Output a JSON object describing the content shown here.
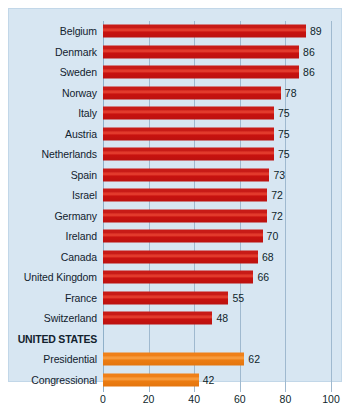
{
  "chart_data": {
    "type": "bar",
    "orientation": "horizontal",
    "title": "",
    "xlabel": "",
    "ylabel": "",
    "xlim": [
      0,
      100
    ],
    "xticks": [
      0,
      20,
      40,
      60,
      80,
      100
    ],
    "grid": true,
    "legend": "none",
    "categories": [
      "Belgium",
      "Denmark",
      "Sweden",
      "Norway",
      "Italy",
      "Austria",
      "Netherlands",
      "Spain",
      "Israel",
      "Germany",
      "Ireland",
      "Canada",
      "United Kingdom",
      "France",
      "Switzerland",
      "UNITED STATES",
      "Presidential",
      "Congressional"
    ],
    "values": [
      89,
      86,
      86,
      78,
      75,
      75,
      75,
      73,
      72,
      72,
      70,
      68,
      66,
      55,
      48,
      null,
      62,
      42
    ],
    "rows": [
      {
        "label": "Belgium",
        "value": 89,
        "color_key": "red",
        "is_heading": false
      },
      {
        "label": "Denmark",
        "value": 86,
        "color_key": "red",
        "is_heading": false
      },
      {
        "label": "Sweden",
        "value": 86,
        "color_key": "red",
        "is_heading": false
      },
      {
        "label": "Norway",
        "value": 78,
        "color_key": "red",
        "is_heading": false
      },
      {
        "label": "Italy",
        "value": 75,
        "color_key": "red",
        "is_heading": false
      },
      {
        "label": "Austria",
        "value": 75,
        "color_key": "red",
        "is_heading": false
      },
      {
        "label": "Netherlands",
        "value": 75,
        "color_key": "red",
        "is_heading": false
      },
      {
        "label": "Spain",
        "value": 73,
        "color_key": "red",
        "is_heading": false
      },
      {
        "label": "Israel",
        "value": 72,
        "color_key": "red",
        "is_heading": false
      },
      {
        "label": "Germany",
        "value": 72,
        "color_key": "red",
        "is_heading": false
      },
      {
        "label": "Ireland",
        "value": 70,
        "color_key": "red",
        "is_heading": false
      },
      {
        "label": "Canada",
        "value": 68,
        "color_key": "red",
        "is_heading": false
      },
      {
        "label": "United Kingdom",
        "value": 66,
        "color_key": "red",
        "is_heading": false
      },
      {
        "label": "France",
        "value": 55,
        "color_key": "red",
        "is_heading": false
      },
      {
        "label": "Switzerland",
        "value": 48,
        "color_key": "red",
        "is_heading": false
      },
      {
        "label": "UNITED STATES",
        "value": null,
        "color_key": null,
        "is_heading": true
      },
      {
        "label": "Presidential",
        "value": 62,
        "color_key": "orange",
        "is_heading": false
      },
      {
        "label": "Congressional",
        "value": 42,
        "color_key": "orange",
        "is_heading": false
      }
    ],
    "colors": {
      "red": "#c81b17",
      "orange": "#ef8019",
      "panel_background": "#d7e6f2",
      "gridline": "#9fb9cf",
      "text": "#12222e"
    }
  }
}
